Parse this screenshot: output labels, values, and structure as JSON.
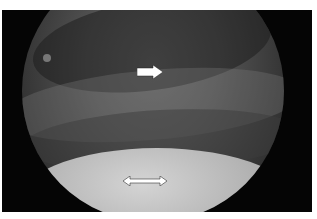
{
  "image": {
    "type": "endoscopic-view",
    "annotations": [
      {
        "kind": "arrow",
        "direction": "right",
        "color": "#ffffff"
      },
      {
        "kind": "double-arrow",
        "direction": "horizontal",
        "color": "#ffffff"
      }
    ]
  }
}
